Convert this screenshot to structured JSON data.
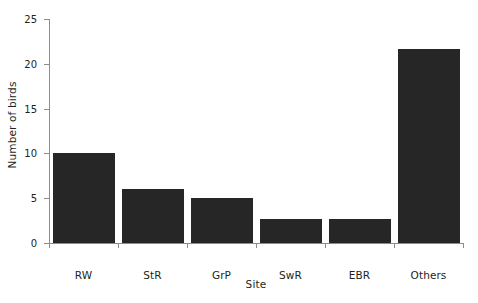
{
  "chart_data": {
    "type": "bar",
    "title": "",
    "subtitle": "",
    "xlabel": "Site",
    "ylabel": "Number of birds",
    "categories": [
      "RW",
      "StR",
      "GrP",
      "SwR",
      "EBR",
      "Others"
    ],
    "values": [
      10,
      6,
      5,
      2.7,
      2.7,
      21.7
    ],
    "series": [
      {
        "name": "Number of birds",
        "values": [
          10,
          6,
          5,
          2.7,
          2.7,
          21.7
        ]
      }
    ],
    "ylim": [
      0,
      25
    ],
    "ytick_labels": [
      "0",
      "5",
      "10",
      "15",
      "20",
      "25"
    ],
    "ytick_values": [
      0,
      5,
      10,
      15,
      20,
      25
    ],
    "grid": false,
    "legend": "none",
    "bar_color": "#262626",
    "axis_color": "#8c8c8c",
    "background_color": "#ffffff",
    "text_color": "#231f20"
  },
  "figure": {
    "background": "#ffffff"
  }
}
